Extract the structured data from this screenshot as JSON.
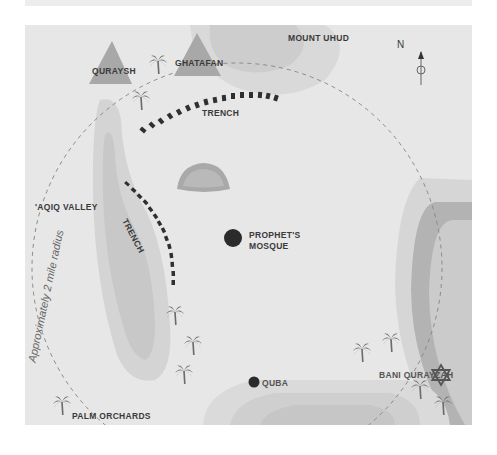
{
  "map": {
    "title": "Battle of the Trench - Medina map",
    "background_color": "#e7e7e7",
    "colors": {
      "terrain_light": "#d9d9d9",
      "terrain_mid": "#c9c9c9",
      "terrain_dark": "#a9a9a9",
      "tent": "#a8a8a8",
      "trench": "#2f2f2f",
      "palm": "#6b6b6b",
      "marker": "#2b2b2b",
      "dashed_line": "#8a8a8a",
      "label": "#3a3a3a"
    },
    "labels": {
      "mount_uhud": "MOUNT UHUD",
      "quraysh": "QURAYSH",
      "ghatafan": "GHATAFAN",
      "trench_north": "TRENCH",
      "trench_west": "TRENCH",
      "aqiq_valley": "'AQIQ VALLEY",
      "prophets_mosque_line1": "PROPHET'S",
      "prophets_mosque_line2": "MOSQUE",
      "bani_qurayzah": "BANI QURAYZAH",
      "quba": "QUBA",
      "palm_orchards": "PALM ORCHARDS",
      "radius": "Approximately 2 mile radius"
    },
    "compass": {
      "label": "N",
      "icon": "north-arrow-icon"
    },
    "icons": {
      "camp": "triangle-tent-icon",
      "palm": "palm-tree-icon",
      "mosque": "filled-circle-icon",
      "star_of_david": "star-of-david-icon"
    }
  }
}
